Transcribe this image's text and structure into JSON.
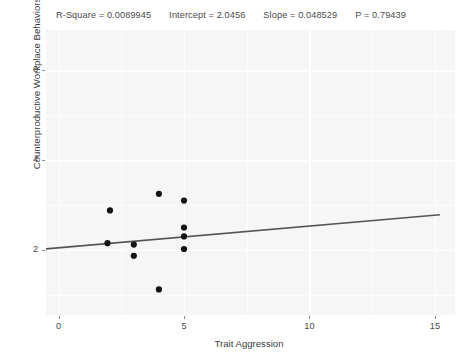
{
  "header": {
    "stats": [
      {
        "name": "r-square",
        "text": "R-Square = 0.0089945"
      },
      {
        "name": "intercept",
        "text": "Intercept = 2.0456"
      },
      {
        "name": "slope",
        "text": "Slope = 0.048529"
      },
      {
        "name": "p-value",
        "text": "P = 0.79439"
      }
    ]
  },
  "chart_data": {
    "type": "scatter",
    "title": "R-Square = 0.0089945   Intercept = 2.0456   Slope = 0.048529   P = 0.79439",
    "xlabel": "Trait Aggression",
    "ylabel": "Counterproductive Workplace Behaviors",
    "xlim": [
      -0.5,
      15.8
    ],
    "ylim": [
      0.55,
      6.9
    ],
    "xticks": [
      0,
      5,
      10,
      15
    ],
    "xtick_labels": [
      "0",
      "5",
      "10",
      "15"
    ],
    "yticks": [
      2,
      4,
      6
    ],
    "ytick_labels": [
      "2",
      "4",
      "6"
    ],
    "grid": true,
    "legend": "none",
    "point_color": "#141414",
    "line_color": "#555555",
    "panel_color": "#f6f6f6",
    "gridline_color": "#ffffff",
    "points": [
      {
        "x": 2.05,
        "y": 2.88
      },
      {
        "x": 1.95,
        "y": 2.15
      },
      {
        "x": 3.0,
        "y": 2.12
      },
      {
        "x": 3.0,
        "y": 1.87
      },
      {
        "x": 4.0,
        "y": 3.25
      },
      {
        "x": 5.0,
        "y": 3.1
      },
      {
        "x": 5.0,
        "y": 2.5
      },
      {
        "x": 5.0,
        "y": 2.3
      },
      {
        "x": 5.0,
        "y": 2.02
      },
      {
        "x": 4.0,
        "y": 1.12
      }
    ],
    "fit_line": {
      "name": "regression-line",
      "intercept": 2.0456,
      "slope": 0.048529,
      "x_start": -0.5,
      "x_end": 15.2
    },
    "r_square": 0.0089945,
    "intercept": 2.0456,
    "slope": 0.048529,
    "p_value": 0.79439
  }
}
